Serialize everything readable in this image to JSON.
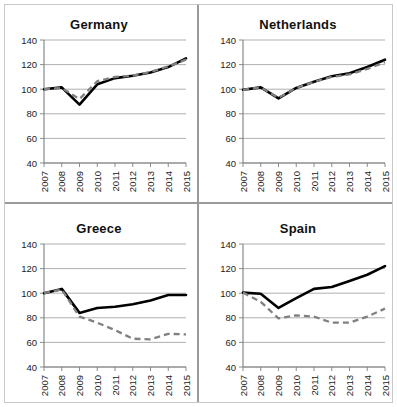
{
  "figure": {
    "name": "four-panel-index-chart",
    "panel_titles": [
      "Germany",
      "Netherlands",
      "Greece",
      "Spain"
    ]
  },
  "axis": {
    "y_ticks": [
      40,
      60,
      80,
      100,
      120,
      140
    ],
    "y_min": 40,
    "y_max": 140,
    "x_ticks": [
      "2007",
      "2008",
      "2009",
      "2010",
      "2011",
      "2012",
      "2013",
      "2014",
      "2015"
    ]
  },
  "colors": {
    "solid_series": "#000000",
    "dashed_series": "#808080",
    "gridline": "#a6a6a6",
    "axis": "#7f7f7f",
    "panel_divider": "#9a9a9a",
    "frame": "#c8c8c8",
    "background": "#ffffff"
  },
  "panels": {
    "germany": {
      "title": "Germany"
    },
    "netherlands": {
      "title": "Netherlands"
    },
    "greece": {
      "title": "Greece"
    },
    "spain": {
      "title": "Spain"
    }
  },
  "chart_data": [
    {
      "type": "line",
      "title": "Germany",
      "xlabel": "",
      "ylabel": "",
      "x": [
        2007,
        2008,
        2009,
        2010,
        2011,
        2012,
        2013,
        2014,
        2015
      ],
      "xlim": [
        2007,
        2015
      ],
      "ylim": [
        40,
        140
      ],
      "yticks": [
        40,
        60,
        80,
        100,
        120,
        140
      ],
      "grid": true,
      "legend": "none",
      "series": [
        {
          "name": "solid",
          "style": "solid",
          "color": "#000000",
          "values": [
            100,
            101.5,
            87.5,
            104,
            109,
            111,
            113.5,
            118,
            125
          ]
        },
        {
          "name": "dashed",
          "style": "dashed",
          "color": "#808080",
          "values": [
            100,
            101,
            92,
            106.5,
            110,
            111,
            114,
            118.5,
            124
          ]
        }
      ]
    },
    {
      "type": "line",
      "title": "Netherlands",
      "xlabel": "",
      "ylabel": "",
      "x": [
        2007,
        2008,
        2009,
        2010,
        2011,
        2012,
        2013,
        2014,
        2015
      ],
      "xlim": [
        2007,
        2015
      ],
      "ylim": [
        40,
        140
      ],
      "yticks": [
        40,
        60,
        80,
        100,
        120,
        140
      ],
      "grid": true,
      "legend": "none",
      "series": [
        {
          "name": "solid",
          "style": "solid",
          "color": "#000000",
          "values": [
            99.5,
            101.5,
            92.5,
            101,
            106,
            110.5,
            113,
            118,
            124
          ]
        },
        {
          "name": "dashed",
          "style": "dashed",
          "color": "#808080",
          "values": [
            99.5,
            101.5,
            93,
            101,
            106,
            110,
            112,
            116.5,
            122
          ]
        }
      ]
    },
    {
      "type": "line",
      "title": "Greece",
      "xlabel": "",
      "ylabel": "",
      "x": [
        2007,
        2008,
        2009,
        2010,
        2011,
        2012,
        2013,
        2014,
        2015
      ],
      "xlim": [
        2007,
        2015
      ],
      "ylim": [
        40,
        140
      ],
      "yticks": [
        40,
        60,
        80,
        100,
        120,
        140
      ],
      "grid": true,
      "legend": "none",
      "series": [
        {
          "name": "solid",
          "style": "solid",
          "color": "#000000",
          "values": [
            100,
            103.5,
            84,
            88,
            89,
            91,
            94,
            98.5,
            98.5
          ]
        },
        {
          "name": "dashed",
          "style": "dashed",
          "color": "#808080",
          "values": [
            100,
            103,
            81,
            76,
            70,
            63,
            62.5,
            67,
            66.5
          ]
        }
      ]
    },
    {
      "type": "line",
      "title": "Spain",
      "xlabel": "",
      "ylabel": "",
      "x": [
        2007,
        2008,
        2009,
        2010,
        2011,
        2012,
        2013,
        2014,
        2015
      ],
      "xlim": [
        2007,
        2015
      ],
      "ylim": [
        40,
        140
      ],
      "yticks": [
        40,
        60,
        80,
        100,
        120,
        140
      ],
      "grid": true,
      "legend": "none",
      "series": [
        {
          "name": "solid",
          "style": "solid",
          "color": "#000000",
          "values": [
            100.5,
            99.5,
            88,
            96,
            103.5,
            105,
            110,
            115,
            122
          ]
        },
        {
          "name": "dashed",
          "style": "dashed",
          "color": "#808080",
          "values": [
            100.5,
            93,
            79.5,
            82,
            81,
            76,
            76,
            81,
            87.5
          ]
        }
      ]
    }
  ]
}
